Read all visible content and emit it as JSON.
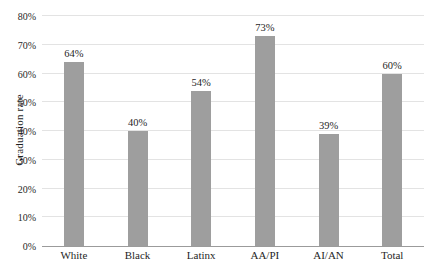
{
  "chart_data": {
    "type": "bar",
    "categories": [
      "White",
      "Black",
      "Latinx",
      "AA/PI",
      "AI/AN",
      "Total"
    ],
    "values": [
      64,
      40,
      54,
      73,
      39,
      60
    ],
    "value_labels": [
      "64%",
      "40%",
      "54%",
      "73%",
      "39%",
      "60%"
    ],
    "title": "",
    "xlabel": "",
    "ylabel": "Graduation rate",
    "ylim": [
      0,
      80
    ],
    "ytick_step": 10,
    "ytick_labels": [
      "0%",
      "10%",
      "20%",
      "30%",
      "40%",
      "50%",
      "60%",
      "70%",
      "80%"
    ],
    "grid": true,
    "legend": "none",
    "bar_color": "#9e9e9e",
    "gridline_color": "#e3e3e3",
    "axis_line_color": "#9b9b9b",
    "text_color": "#1f1f1f",
    "background_color": "#ffffff"
  }
}
